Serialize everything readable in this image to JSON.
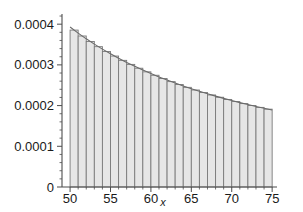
{
  "chart_data": {
    "type": "bar",
    "title": "",
    "subtitle": "",
    "xlabel": "x",
    "ylabel": "",
    "xlim": [
      49.0,
      75.6
    ],
    "ylim": [
      0,
      0.000425
    ],
    "grid": false,
    "legend": null,
    "bar_edge_color": "#7a7a7a",
    "bar_fill_color": "#e6e6e6",
    "curve_color": "#6a6a6a",
    "axis_color": "#4d4d4d",
    "categories": [
      50,
      51,
      52,
      53,
      54,
      55,
      56,
      57,
      58,
      59,
      60,
      61,
      62,
      63,
      64,
      65,
      66,
      67,
      68,
      69,
      70,
      71,
      72,
      73,
      74
    ],
    "values": [
      0.0003855,
      0.000371,
      0.0003575,
      0.0003448,
      0.0003329,
      0.0003217,
      0.0003111,
      0.0003012,
      0.0002918,
      0.0002829,
      0.0002745,
      0.0002665,
      0.0002589,
      0.0002517,
      0.0002448,
      0.0002383,
      0.0002321,
      0.0002261,
      0.0002205,
      0.0002151,
      0.0002099,
      0.0002049,
      0.0002002,
      0.0001956,
      0.0001912
    ],
    "curve": {
      "x": [
        50,
        51,
        52,
        53,
        54,
        55,
        56,
        57,
        58,
        59,
        60,
        61,
        62,
        63,
        64,
        65,
        66,
        67,
        68,
        69,
        70,
        71,
        72,
        73,
        74,
        75
      ],
      "y": [
        0.000393,
        0.000378,
        0.000364,
        0.000351,
        0.0003387,
        0.0003272,
        0.0003163,
        0.0003061,
        0.0002964,
        0.0002873,
        0.0002787,
        0.0002705,
        0.0002627,
        0.0002553,
        0.0002482,
        0.0002415,
        0.0002351,
        0.000229,
        0.0002232,
        0.0002177,
        0.0002124,
        0.0002073,
        0.0002025,
        0.0001978,
        0.0001933,
        0.000189
      ]
    },
    "yticks": [
      {
        "value": 0,
        "label": "0"
      },
      {
        "value": 0.0001,
        "label": "0.0001"
      },
      {
        "value": 0.0002,
        "label": "0.0002"
      },
      {
        "value": 0.0003,
        "label": "0.0003"
      },
      {
        "value": 0.0004,
        "label": "0.0004"
      }
    ],
    "xticks": [
      {
        "value": 50,
        "label": "50"
      },
      {
        "value": 55,
        "label": "55"
      },
      {
        "value": 60,
        "label": "60"
      },
      {
        "value": 65,
        "label": "65"
      },
      {
        "value": 70,
        "label": "70"
      },
      {
        "value": 75,
        "label": "75"
      }
    ],
    "xminor_step": 1,
    "yminor_step": 2e-05
  }
}
